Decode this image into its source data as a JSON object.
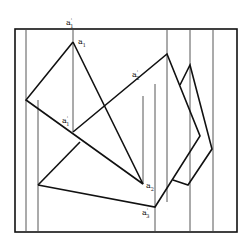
{
  "diagram": {
    "type": "descriptive-geometry-projection",
    "frame": {
      "x": 15,
      "y": 29,
      "width": 222,
      "height": 203
    },
    "projection_lines_x": [
      26,
      38,
      73,
      143,
      155,
      167,
      190,
      213
    ],
    "labels": [
      {
        "id": "a1_prime_top",
        "base": "a",
        "prime": "'",
        "sub": "1",
        "x": 66,
        "y": 25
      },
      {
        "id": "a1",
        "base": "a",
        "prime": "",
        "sub": "1",
        "x": 78,
        "y": 44
      },
      {
        "id": "a2_prime",
        "base": "a",
        "prime": "'",
        "sub": "2",
        "x": 132,
        "y": 77
      },
      {
        "id": "a1_prime_mid",
        "base": "a",
        "prime": "'",
        "sub": "1",
        "x": 62,
        "y": 123
      },
      {
        "id": "a2",
        "base": "a",
        "prime": "",
        "sub": "2",
        "x": 146,
        "y": 188
      },
      {
        "id": "a3_prime",
        "base": "a",
        "prime": "'",
        "sub": "3",
        "x": 142,
        "y": 215
      }
    ]
  }
}
